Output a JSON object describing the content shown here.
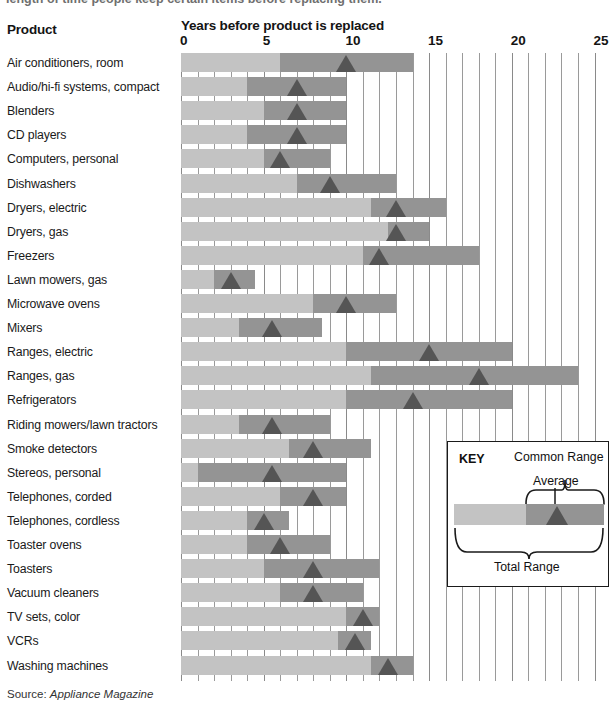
{
  "intro": {
    "text": "length of time people keep certain items before replacing them."
  },
  "header": {
    "product_col": "Product",
    "axis_title": "Years before product is replaced"
  },
  "source": {
    "label": "Source:",
    "value": "Appliance Magazine"
  },
  "key": {
    "title": "KEY",
    "common_range": "Common Range",
    "average": "Average",
    "total_range": "Total Range"
  },
  "colors": {
    "total_range": "#c3c3c3",
    "common_range": "#949494",
    "average_marker": "#555555",
    "gridline": "#9a9a9a",
    "text": "#1a1a1a"
  },
  "chart_data": {
    "type": "bar",
    "title": "Years before product is replaced",
    "xlabel": "Years before product is replaced",
    "ylabel": "Product",
    "xlim": [
      0,
      25
    ],
    "xticks": [
      0,
      5,
      10,
      15,
      20,
      25
    ],
    "tick_labels": [
      "0",
      "5",
      "10",
      "15",
      "20",
      "25"
    ],
    "minor_tick_step": 1,
    "grid": true,
    "legend": {
      "position": "inside-right",
      "entries": [
        "Total Range",
        "Common Range",
        "Average"
      ]
    },
    "categories": [
      "Air conditioners, room",
      "Audio/hi-fi systems, compact",
      "Blenders",
      "CD players",
      "Computers, personal",
      "Dishwashers",
      "Dryers, electric",
      "Dryers, gas",
      "Freezers",
      "Lawn mowers, gas",
      "Microwave ovens",
      "Mixers",
      "Ranges, electric",
      "Ranges, gas",
      "Refrigerators",
      "Riding mowers/lawn tractors",
      "Smoke detectors",
      "Stereos, personal",
      "Telephones, corded",
      "Telephones, cordless",
      "Toaster ovens",
      "Toasters",
      "Vacuum cleaners",
      "TV sets, color",
      "VCRs",
      "Washing machines"
    ],
    "series": [
      {
        "name": "Total Range",
        "field": "total_range"
      },
      {
        "name": "Common Range",
        "field": "common_range"
      },
      {
        "name": "Average",
        "field": "average"
      }
    ],
    "rows": [
      {
        "label": "Air conditioners, room",
        "total_range": [
          0,
          14.0
        ],
        "common_range": [
          6.0,
          14.0
        ],
        "average": 10.0
      },
      {
        "label": "Audio/hi-fi systems, compact",
        "total_range": [
          0,
          10.0
        ],
        "common_range": [
          4.0,
          10.0
        ],
        "average": 7.0
      },
      {
        "label": "Blenders",
        "total_range": [
          0,
          10.0
        ],
        "common_range": [
          5.0,
          10.0
        ],
        "average": 7.0
      },
      {
        "label": "CD players",
        "total_range": [
          0,
          10.0
        ],
        "common_range": [
          4.0,
          10.0
        ],
        "average": 7.0
      },
      {
        "label": "Computers, personal",
        "total_range": [
          0,
          9.0
        ],
        "common_range": [
          5.0,
          9.0
        ],
        "average": 6.0
      },
      {
        "label": "Dishwashers",
        "total_range": [
          0,
          13.0
        ],
        "common_range": [
          7.0,
          13.0
        ],
        "average": 9.0
      },
      {
        "label": "Dryers, electric",
        "total_range": [
          0,
          16.0
        ],
        "common_range": [
          11.5,
          16.0
        ],
        "average": 13.0
      },
      {
        "label": "Dryers, gas",
        "total_range": [
          0,
          15.0
        ],
        "common_range": [
          12.5,
          15.0
        ],
        "average": 13.0
      },
      {
        "label": "Freezers",
        "total_range": [
          0,
          18.0
        ],
        "common_range": [
          11.0,
          18.0
        ],
        "average": 12.0
      },
      {
        "label": "Lawn mowers, gas",
        "total_range": [
          0,
          4.5
        ],
        "common_range": [
          2.0,
          4.5
        ],
        "average": 3.0
      },
      {
        "label": "Microwave ovens",
        "total_range": [
          0,
          13.0
        ],
        "common_range": [
          8.0,
          13.0
        ],
        "average": 10.0
      },
      {
        "label": "Mixers",
        "total_range": [
          0,
          8.5
        ],
        "common_range": [
          3.5,
          8.5
        ],
        "average": 5.5
      },
      {
        "label": "Ranges, electric",
        "total_range": [
          0,
          20.0
        ],
        "common_range": [
          10.0,
          20.0
        ],
        "average": 15.0
      },
      {
        "label": "Ranges, gas",
        "total_range": [
          0,
          24.0
        ],
        "common_range": [
          11.5,
          24.0
        ],
        "average": 18.0
      },
      {
        "label": "Refrigerators",
        "total_range": [
          0,
          20.0
        ],
        "common_range": [
          10.0,
          20.0
        ],
        "average": 14.0
      },
      {
        "label": "Riding mowers/lawn tractors",
        "total_range": [
          0,
          9.0
        ],
        "common_range": [
          3.5,
          9.0
        ],
        "average": 5.5
      },
      {
        "label": "Smoke detectors",
        "total_range": [
          0,
          11.5
        ],
        "common_range": [
          6.5,
          11.5
        ],
        "average": 8.0
      },
      {
        "label": "Stereos, personal",
        "total_range": [
          0,
          10.0
        ],
        "common_range": [
          1.0,
          10.0
        ],
        "average": 5.5
      },
      {
        "label": "Telephones, corded",
        "total_range": [
          0,
          10.0
        ],
        "common_range": [
          6.0,
          10.0
        ],
        "average": 8.0
      },
      {
        "label": "Telephones, cordless",
        "total_range": [
          0,
          6.5
        ],
        "common_range": [
          4.0,
          6.5
        ],
        "average": 5.0
      },
      {
        "label": "Toaster ovens",
        "total_range": [
          0,
          9.0
        ],
        "common_range": [
          4.0,
          9.0
        ],
        "average": 6.0
      },
      {
        "label": "Toasters",
        "total_range": [
          0,
          12.0
        ],
        "common_range": [
          5.0,
          12.0
        ],
        "average": 8.0
      },
      {
        "label": "Vacuum cleaners",
        "total_range": [
          0,
          11.0
        ],
        "common_range": [
          6.0,
          11.0
        ],
        "average": 8.0
      },
      {
        "label": "TV sets, color",
        "total_range": [
          0,
          12.0
        ],
        "common_range": [
          10.0,
          12.0
        ],
        "average": 11.0
      },
      {
        "label": "VCRs",
        "total_range": [
          0,
          11.5
        ],
        "common_range": [
          9.5,
          11.5
        ],
        "average": 10.5
      },
      {
        "label": "Washing machines",
        "total_range": [
          0,
          14.0
        ],
        "common_range": [
          11.5,
          14.0
        ],
        "average": 12.5
      }
    ]
  }
}
